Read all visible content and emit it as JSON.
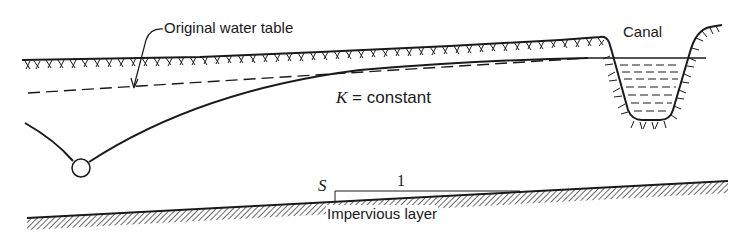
{
  "diagram": {
    "labels": {
      "original_water_table": "Original water table",
      "canal": "Canal",
      "k_symbol": "K",
      "k_rest": " = constant",
      "slope_s": "S",
      "slope_run": "1",
      "impervious_layer": "Impervious layer"
    },
    "elements": [
      "ground-surface",
      "canal",
      "canal-water",
      "original-water-table",
      "drawdown-curve",
      "well",
      "impervious-layer",
      "slope-indicator"
    ],
    "colors": {
      "ink": "#1a1a1a",
      "background": "#ffffff"
    }
  }
}
